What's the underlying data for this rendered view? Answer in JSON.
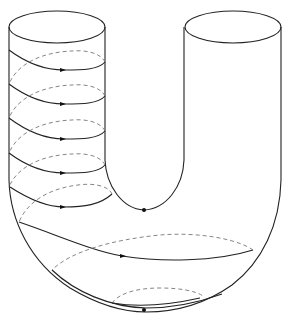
{
  "figure": {
    "stroke_color": "#222222",
    "dashed_color": "#777777",
    "background": "#ffffff",
    "elements": {
      "left_cylinder": "left-cylinder",
      "right_cylinder": "right-cylinder",
      "helix": "helix-curve-with-arrows",
      "inner_point": "point-inner-bottom",
      "bottom_loop": "closed-curve-bottom",
      "bottom_point": "point-outer-bottom"
    },
    "helix_turns": 5,
    "marked_points": 2
  }
}
